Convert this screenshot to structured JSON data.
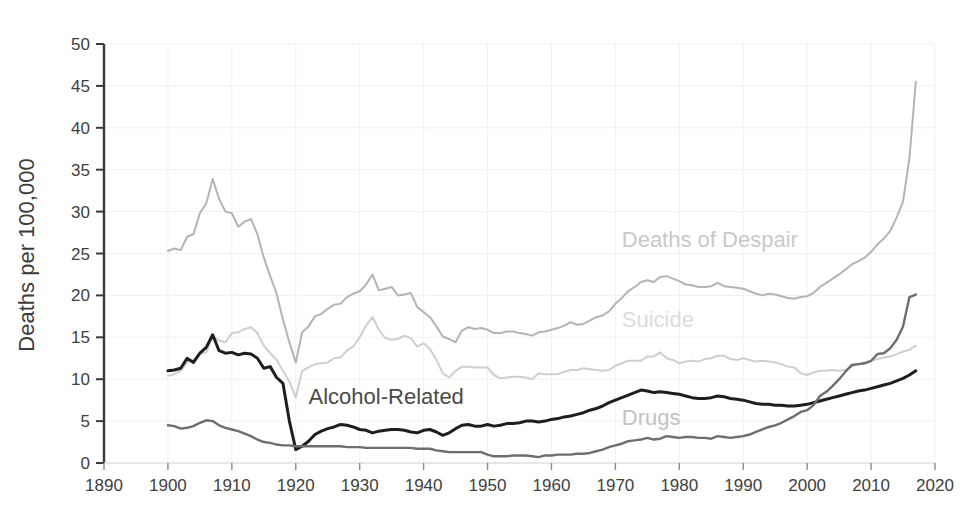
{
  "chart_data": {
    "type": "line",
    "title": "",
    "subtitle": "",
    "xlabel": "",
    "ylabel": "Deaths per 100,000",
    "xlim": [
      1890,
      2020
    ],
    "ylim": [
      0,
      50
    ],
    "xticks": [
      1890,
      1900,
      1910,
      1920,
      1930,
      1940,
      1950,
      1960,
      1970,
      1980,
      1990,
      2000,
      2010,
      2020
    ],
    "yticks": [
      0,
      5,
      10,
      15,
      20,
      25,
      30,
      35,
      40,
      45,
      50
    ],
    "grid": true,
    "legend_position": "inline-annotations",
    "annotations": [
      {
        "text": "Deaths of Despair",
        "x": 1971,
        "y": 25.8,
        "color": "#c9c9c9"
      },
      {
        "text": "Suicide",
        "x": 1971,
        "y": 16.2,
        "color": "#dcdcdc"
      },
      {
        "text": "Alcohol-Related",
        "x": 1922,
        "y": 7.0,
        "color": "#4a4a4a"
      },
      {
        "text": "Drugs",
        "x": 1971,
        "y": 4.5,
        "color": "#c2c2c2"
      }
    ],
    "series": [
      {
        "name": "Deaths of Despair",
        "color": "#b4b4b4",
        "width": 2.0,
        "x": [
          1900,
          1901,
          1902,
          1903,
          1904,
          1905,
          1906,
          1907,
          1908,
          1909,
          1910,
          1911,
          1912,
          1913,
          1914,
          1915,
          1916,
          1917,
          1918,
          1919,
          1920,
          1921,
          1922,
          1923,
          1924,
          1925,
          1926,
          1927,
          1928,
          1929,
          1930,
          1931,
          1932,
          1933,
          1934,
          1935,
          1936,
          1937,
          1938,
          1939,
          1940,
          1941,
          1942,
          1943,
          1944,
          1945,
          1946,
          1947,
          1948,
          1949,
          1950,
          1951,
          1952,
          1953,
          1954,
          1955,
          1956,
          1957,
          1958,
          1959,
          1960,
          1961,
          1962,
          1963,
          1964,
          1965,
          1966,
          1967,
          1968,
          1969,
          1970,
          1971,
          1972,
          1973,
          1974,
          1975,
          1976,
          1977,
          1978,
          1979,
          1980,
          1981,
          1982,
          1983,
          1984,
          1985,
          1986,
          1987,
          1988,
          1989,
          1990,
          1991,
          1992,
          1993,
          1994,
          1995,
          1996,
          1997,
          1998,
          1999,
          2000,
          2001,
          2002,
          2003,
          2004,
          2005,
          2006,
          2007,
          2008,
          2009,
          2010,
          2011,
          2012,
          2013,
          2014,
          2015,
          2016,
          2017
        ],
        "y": [
          25.3,
          25.6,
          25.4,
          27.0,
          27.3,
          29.8,
          31.0,
          33.9,
          31.5,
          30.0,
          29.8,
          28.2,
          28.8,
          29.1,
          27.3,
          24.5,
          22.3,
          20.2,
          17.1,
          14.4,
          12.0,
          15.6,
          16.3,
          17.5,
          17.8,
          18.4,
          18.9,
          19.0,
          19.8,
          20.2,
          20.5,
          21.3,
          22.5,
          20.6,
          20.8,
          21.0,
          20.0,
          20.1,
          20.3,
          18.6,
          18.0,
          17.4,
          16.3,
          15.1,
          14.8,
          14.4,
          15.8,
          16.2,
          16.0,
          16.1,
          15.9,
          15.5,
          15.5,
          15.7,
          15.7,
          15.5,
          15.4,
          15.2,
          15.6,
          15.7,
          15.9,
          16.1,
          16.4,
          16.8,
          16.5,
          16.6,
          17.0,
          17.4,
          17.6,
          18.1,
          19.0,
          19.7,
          20.5,
          21.0,
          21.6,
          21.8,
          21.6,
          22.2,
          22.3,
          22.0,
          21.7,
          21.3,
          21.2,
          21.0,
          21.0,
          21.1,
          21.5,
          21.1,
          21.0,
          20.9,
          20.8,
          20.5,
          20.2,
          20.0,
          20.2,
          20.1,
          19.9,
          19.7,
          19.6,
          19.8,
          19.9,
          20.3,
          21.0,
          21.5,
          22.0,
          22.5,
          23.1,
          23.7,
          24.1,
          24.5,
          25.2,
          26.1,
          26.8,
          27.7,
          29.3,
          31.2,
          36.4,
          45.5
        ]
      },
      {
        "name": "Suicide",
        "color": "#cecece",
        "width": 2.0,
        "x": [
          1900,
          1901,
          1902,
          1903,
          1904,
          1905,
          1906,
          1907,
          1908,
          1909,
          1910,
          1911,
          1912,
          1913,
          1914,
          1915,
          1916,
          1917,
          1918,
          1919,
          1920,
          1921,
          1922,
          1923,
          1924,
          1925,
          1926,
          1927,
          1928,
          1929,
          1930,
          1931,
          1932,
          1933,
          1934,
          1935,
          1936,
          1937,
          1938,
          1939,
          1940,
          1941,
          1942,
          1943,
          1944,
          1945,
          1946,
          1947,
          1948,
          1949,
          1950,
          1951,
          1952,
          1953,
          1954,
          1955,
          1956,
          1957,
          1958,
          1959,
          1960,
          1961,
          1962,
          1963,
          1964,
          1965,
          1966,
          1967,
          1968,
          1969,
          1970,
          1971,
          1972,
          1973,
          1974,
          1975,
          1976,
          1977,
          1978,
          1979,
          1980,
          1981,
          1982,
          1983,
          1984,
          1985,
          1986,
          1987,
          1988,
          1989,
          1990,
          1991,
          1992,
          1993,
          1994,
          1995,
          1996,
          1997,
          1998,
          1999,
          2000,
          2001,
          2002,
          2003,
          2004,
          2005,
          2006,
          2007,
          2008,
          2009,
          2010,
          2011,
          2012,
          2013,
          2014,
          2015,
          2016,
          2017
        ],
        "y": [
          10.4,
          10.6,
          11.0,
          12.0,
          12.3,
          13.0,
          13.2,
          15.1,
          14.6,
          14.4,
          15.5,
          15.6,
          16.0,
          16.2,
          15.5,
          14.0,
          13.1,
          12.3,
          11.0,
          9.7,
          7.8,
          11.0,
          11.4,
          11.8,
          11.9,
          12.0,
          12.5,
          12.6,
          13.4,
          13.9,
          15.0,
          16.4,
          17.4,
          15.9,
          14.9,
          14.7,
          14.8,
          15.2,
          14.9,
          13.9,
          14.3,
          13.6,
          12.3,
          10.7,
          10.2,
          11.0,
          11.5,
          11.5,
          11.4,
          11.4,
          11.4,
          10.5,
          10.1,
          10.2,
          10.3,
          10.3,
          10.2,
          10.0,
          10.7,
          10.6,
          10.6,
          10.6,
          10.9,
          11.1,
          11.1,
          11.3,
          11.2,
          11.1,
          11.0,
          11.1,
          11.6,
          11.9,
          12.2,
          12.2,
          12.2,
          12.7,
          12.7,
          13.2,
          12.5,
          12.3,
          11.9,
          12.1,
          12.2,
          12.1,
          12.4,
          12.5,
          12.8,
          12.8,
          12.4,
          12.3,
          12.5,
          12.3,
          12.1,
          12.2,
          12.1,
          12.0,
          11.8,
          11.5,
          11.4,
          10.7,
          10.5,
          10.8,
          11.0,
          11.0,
          11.1,
          11.0,
          11.1,
          11.5,
          11.8,
          12.0,
          12.2,
          12.4,
          12.6,
          12.7,
          13.0,
          13.3,
          13.5,
          14.0
        ]
      },
      {
        "name": "Alcohol-Related",
        "color": "#1e1e1e",
        "width": 3.0,
        "x": [
          1900,
          1901,
          1902,
          1903,
          1904,
          1905,
          1906,
          1907,
          1908,
          1909,
          1910,
          1911,
          1912,
          1913,
          1914,
          1915,
          1916,
          1917,
          1918,
          1919,
          1920,
          1921,
          1922,
          1923,
          1924,
          1925,
          1926,
          1927,
          1928,
          1929,
          1930,
          1931,
          1932,
          1933,
          1934,
          1935,
          1936,
          1937,
          1938,
          1939,
          1940,
          1941,
          1942,
          1943,
          1944,
          1945,
          1946,
          1947,
          1948,
          1949,
          1950,
          1951,
          1952,
          1953,
          1954,
          1955,
          1956,
          1957,
          1958,
          1959,
          1960,
          1961,
          1962,
          1963,
          1964,
          1965,
          1966,
          1967,
          1968,
          1969,
          1970,
          1971,
          1972,
          1973,
          1974,
          1975,
          1976,
          1977,
          1978,
          1979,
          1980,
          1981,
          1982,
          1983,
          1984,
          1985,
          1986,
          1987,
          1988,
          1989,
          1990,
          1991,
          1992,
          1993,
          1994,
          1995,
          1996,
          1997,
          1998,
          1999,
          2000,
          2001,
          2002,
          2003,
          2004,
          2005,
          2006,
          2007,
          2008,
          2009,
          2010,
          2011,
          2012,
          2013,
          2014,
          2015,
          2016,
          2017
        ],
        "y": [
          11.0,
          11.1,
          11.3,
          12.5,
          12.0,
          13.1,
          13.8,
          15.3,
          13.4,
          13.1,
          13.2,
          12.9,
          13.1,
          13.0,
          12.5,
          11.3,
          11.5,
          10.2,
          9.5,
          5.0,
          1.6,
          2.0,
          2.6,
          3.4,
          3.8,
          4.1,
          4.3,
          4.6,
          4.5,
          4.3,
          4.0,
          3.9,
          3.6,
          3.8,
          3.9,
          4.0,
          4.0,
          3.9,
          3.7,
          3.6,
          3.9,
          4.0,
          3.7,
          3.3,
          3.6,
          4.1,
          4.5,
          4.6,
          4.4,
          4.4,
          4.6,
          4.4,
          4.5,
          4.7,
          4.7,
          4.8,
          5.0,
          5.0,
          4.9,
          5.0,
          5.2,
          5.3,
          5.5,
          5.6,
          5.8,
          6.0,
          6.3,
          6.5,
          6.8,
          7.2,
          7.5,
          7.8,
          8.1,
          8.4,
          8.7,
          8.6,
          8.4,
          8.5,
          8.4,
          8.3,
          8.2,
          8.0,
          7.8,
          7.7,
          7.7,
          7.8,
          8.0,
          7.9,
          7.7,
          7.6,
          7.5,
          7.3,
          7.1,
          7.0,
          7.0,
          6.9,
          6.9,
          6.8,
          6.8,
          6.9,
          7.0,
          7.2,
          7.4,
          7.6,
          7.8,
          8.0,
          8.2,
          8.4,
          8.6,
          8.7,
          8.9,
          9.1,
          9.3,
          9.5,
          9.8,
          10.1,
          10.5,
          11.0
        ]
      },
      {
        "name": "Drugs",
        "color": "#6e6e6e",
        "width": 2.4,
        "x": [
          1900,
          1901,
          1902,
          1903,
          1904,
          1905,
          1906,
          1907,
          1908,
          1909,
          1910,
          1911,
          1912,
          1913,
          1914,
          1915,
          1916,
          1917,
          1918,
          1919,
          1920,
          1921,
          1922,
          1923,
          1924,
          1925,
          1926,
          1927,
          1928,
          1929,
          1930,
          1931,
          1932,
          1933,
          1934,
          1935,
          1936,
          1937,
          1938,
          1939,
          1940,
          1941,
          1942,
          1943,
          1944,
          1945,
          1946,
          1947,
          1948,
          1949,
          1950,
          1951,
          1952,
          1953,
          1954,
          1955,
          1956,
          1957,
          1958,
          1959,
          1960,
          1961,
          1962,
          1963,
          1964,
          1965,
          1966,
          1967,
          1968,
          1969,
          1970,
          1971,
          1972,
          1973,
          1974,
          1975,
          1976,
          1977,
          1978,
          1979,
          1980,
          1981,
          1982,
          1983,
          1984,
          1985,
          1986,
          1987,
          1988,
          1989,
          1990,
          1991,
          1992,
          1993,
          1994,
          1995,
          1996,
          1997,
          1998,
          1999,
          2000,
          2001,
          2002,
          2003,
          2004,
          2005,
          2006,
          2007,
          2008,
          2009,
          2010,
          2011,
          2012,
          2013,
          2014,
          2015,
          2016,
          2017
        ],
        "y": [
          4.5,
          4.4,
          4.1,
          4.2,
          4.4,
          4.8,
          5.1,
          5.0,
          4.5,
          4.2,
          4.0,
          3.8,
          3.5,
          3.2,
          2.8,
          2.5,
          2.4,
          2.2,
          2.1,
          2.1,
          2.0,
          2.0,
          2.0,
          2.0,
          2.0,
          2.0,
          2.0,
          2.0,
          1.9,
          1.9,
          1.9,
          1.8,
          1.8,
          1.8,
          1.8,
          1.8,
          1.8,
          1.8,
          1.8,
          1.7,
          1.7,
          1.7,
          1.5,
          1.4,
          1.3,
          1.3,
          1.3,
          1.3,
          1.3,
          1.3,
          1.0,
          0.8,
          0.8,
          0.8,
          0.9,
          0.9,
          0.9,
          0.8,
          0.7,
          0.9,
          0.9,
          1.0,
          1.0,
          1.0,
          1.1,
          1.1,
          1.2,
          1.4,
          1.6,
          1.9,
          2.1,
          2.3,
          2.6,
          2.7,
          2.8,
          3.0,
          2.8,
          2.9,
          3.2,
          3.1,
          3.0,
          3.1,
          3.1,
          3.0,
          3.0,
          2.9,
          3.2,
          3.1,
          3.0,
          3.1,
          3.2,
          3.4,
          3.7,
          4.0,
          4.3,
          4.5,
          4.8,
          5.2,
          5.6,
          6.1,
          6.3,
          6.9,
          8.0,
          8.5,
          9.2,
          10.0,
          10.9,
          11.7,
          11.8,
          11.9,
          12.2,
          13.0,
          13.1,
          13.7,
          14.7,
          16.3,
          19.8,
          20.1
        ]
      }
    ]
  }
}
